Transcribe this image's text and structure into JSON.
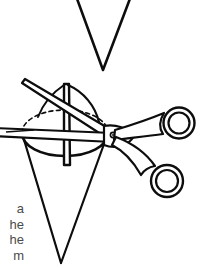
{
  "figure": {
    "line_color": "#0d0d0d",
    "fill_color": "#ffffff",
    "hidden_edge_style": "dashed",
    "elements": [
      "upper-cross-section-v",
      "lower-cone",
      "cone-base-ellipse",
      "cutting-plane",
      "scissors"
    ]
  },
  "caption": {
    "lines": [
      "a",
      "he",
      "he",
      "m"
    ],
    "note": "text clipped at left page edge"
  },
  "colors": {
    "ink": "#0d0d0d",
    "paper": "#ffffff",
    "caption_text": "#4a4a4a"
  }
}
